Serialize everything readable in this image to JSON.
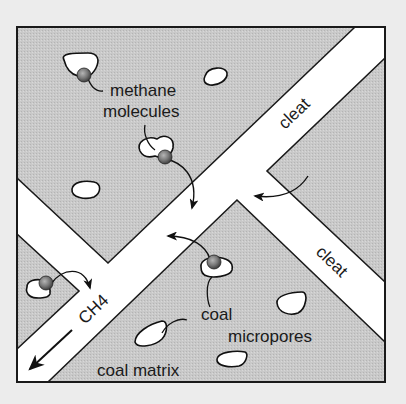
{
  "diagram": {
    "colors": {
      "page_background": "#ececec",
      "coal_matrix_fill": "#c7c7c7",
      "cleat_fill": "#ffffff",
      "outline": "#1a1a1a",
      "molecule_fill": "#7a7a7a"
    },
    "labels": {
      "methane_line1": "methane",
      "methane_line2": "molecules",
      "cleat_top": "cleat",
      "cleat_right": "cleat",
      "ch4": "CH4",
      "coal": "coal",
      "micropores": "micropores",
      "coal_matrix": "coal matrix"
    },
    "regions": [
      {
        "name": "coal matrix",
        "type": "shaded area"
      },
      {
        "name": "main cleat",
        "orientation": "diagonal bottom-left to top-right"
      },
      {
        "name": "branch cleat left",
        "orientation": "diagonal top-left to center"
      },
      {
        "name": "branch cleat right",
        "orientation": "diagonal center to bottom-right"
      }
    ],
    "elements": {
      "micropores_count": 9,
      "methane_molecules_count": 4,
      "flow_arrows_count": 5
    }
  }
}
